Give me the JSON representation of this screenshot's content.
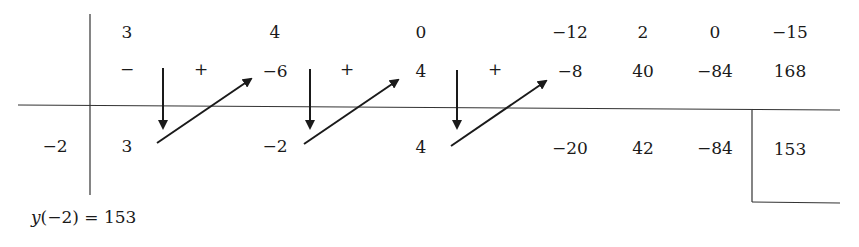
{
  "diagram": {
    "type": "synthetic-division-horner-scheme",
    "divisor_root": "−2",
    "coefficients_row": [
      "3",
      "4",
      "0",
      "−12",
      "2",
      "0",
      "−15"
    ],
    "products_row_signs": {
      "minus": "−",
      "plus": "+"
    },
    "products_row": [
      "−6",
      "4",
      "−8",
      "40",
      "−84",
      "168"
    ],
    "result_row": [
      "3",
      "−2",
      "4",
      "−20",
      "42",
      "−84"
    ],
    "remainder": "153",
    "conclusion_lhs": "y",
    "conclusion_arg": "(−2)",
    "conclusion_rhs": " = 153",
    "line_color": "#1a1a1a"
  }
}
